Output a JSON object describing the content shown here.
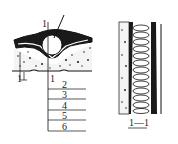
{
  "diagram": {
    "type": "engineering-cross-section",
    "main_view": {
      "section_marker_top": "1",
      "section_marker_bottom": "1",
      "callout_origin": "1",
      "layers": [
        {
          "number": "2"
        },
        {
          "number": "3"
        },
        {
          "number": "4"
        },
        {
          "number": "5"
        },
        {
          "number": "6"
        }
      ]
    },
    "section_view": {
      "caption": "1—1"
    },
    "colors": {
      "ink": "#1a1a1a",
      "background": "#ffffff"
    }
  }
}
